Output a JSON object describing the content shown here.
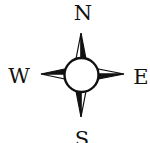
{
  "compass": {
    "labels": {
      "north": "N",
      "east": "E",
      "south": "S",
      "west": "W"
    },
    "colors": {
      "ink": "#111111",
      "background": "#ffffff",
      "rose_fill": "#ffffff"
    }
  }
}
